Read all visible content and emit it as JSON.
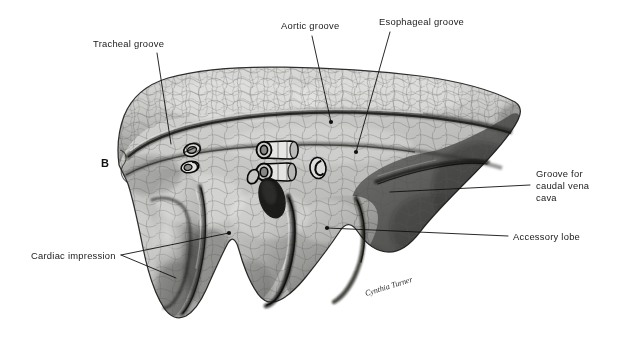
{
  "figure": {
    "panel_letter": "B",
    "caption_subject": "Medial surface of lung",
    "signature": "Cynthia Turner",
    "background_color": "#ffffff",
    "ink_color": "#111111",
    "label_color": "#1a1a1a"
  },
  "annotations": [
    {
      "id": "tracheal-groove",
      "lines": [
        "Tracheal groove"
      ],
      "text_x": 93,
      "text_y": 47,
      "leader": [
        [
          157,
          53
        ],
        [
          171,
          144
        ]
      ],
      "dot": null
    },
    {
      "id": "aortic-groove",
      "lines": [
        "Aortic groove"
      ],
      "text_x": 281,
      "text_y": 29,
      "leader": [
        [
          312,
          36
        ],
        [
          331,
          122
        ]
      ],
      "dot": [
        331,
        122
      ]
    },
    {
      "id": "esophageal-groove",
      "lines": [
        "Esophageal groove"
      ],
      "text_x": 379,
      "text_y": 25,
      "leader": [
        [
          390,
          32
        ],
        [
          356,
          152
        ]
      ],
      "dot": [
        356,
        152
      ]
    },
    {
      "id": "groove-for-caudal-vena-cava",
      "lines": [
        "Groove for",
        "caudal vena",
        "cava"
      ],
      "text_x": 536,
      "text_y": 177,
      "leader": [
        [
          530,
          185
        ],
        [
          390,
          192
        ]
      ],
      "dot": null
    },
    {
      "id": "accessory-lobe",
      "lines": [
        "Accessory lobe"
      ],
      "text_x": 513,
      "text_y": 240,
      "leader": [
        [
          508,
          236
        ],
        [
          327,
          228
        ]
      ],
      "dot": [
        327,
        228
      ]
    },
    {
      "id": "cardiac-impression",
      "lines": [
        "Cardiac impression"
      ],
      "text_x": 31,
      "text_y": 259,
      "leader_fork": [
        [
          [
            121,
            255
          ],
          [
            229,
            233
          ]
        ],
        [
          [
            121,
            255
          ],
          [
            176,
            278
          ]
        ]
      ],
      "dot": [
        229,
        233
      ]
    }
  ],
  "hilar_structures": [
    {
      "id": "bronchus-section-left-upper",
      "cx": 192,
      "cy": 150
    },
    {
      "id": "vessel-section-left-lower",
      "cx": 190,
      "cy": 167
    },
    {
      "id": "bronchus-section-central-upper",
      "cx": 274,
      "cy": 150
    },
    {
      "id": "bronchus-section-central-lower",
      "cx": 272,
      "cy": 172
    },
    {
      "id": "vessel-section-small-left",
      "cx": 253,
      "cy": 176
    },
    {
      "id": "vessel-section-right",
      "cx": 318,
      "cy": 168
    },
    {
      "id": "hilar-notch-dark",
      "cx": 272,
      "cy": 196
    }
  ]
}
